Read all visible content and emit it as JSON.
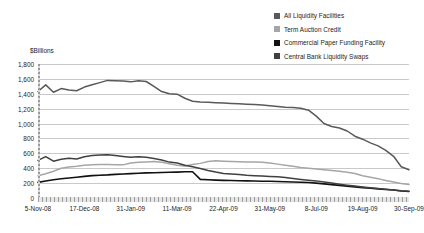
{
  "legend": {
    "position": "top-right",
    "items": [
      {
        "label": "All Liquidity Facilities",
        "color": "#595959",
        "swatch": "legend-swatch-all-liquidity"
      },
      {
        "label": "Term Auction Credit",
        "color": "#a6a6a6",
        "swatch": "legend-swatch-term-auction"
      },
      {
        "label": "Commercial Paper Funding Facility",
        "color": "#111111",
        "swatch": "legend-swatch-cpff"
      },
      {
        "label": "Central Bank Liquidity Swaps",
        "color": "#404040",
        "swatch": "legend-swatch-swaps"
      }
    ]
  },
  "axis": {
    "y_title": "$Billions",
    "y_ticks": [
      "1,800",
      "1,600",
      "1,400",
      "1,200",
      "1,000",
      "800",
      "600",
      "400",
      "200",
      "0"
    ],
    "x_ticks": [
      "5-Nov-08",
      "17-Dec-08",
      "31-Jan-09",
      "11-Mar-09",
      "22-Apr-09",
      "31-May-09",
      "8-Jul-09",
      "19-Aug-09",
      "30-Sep-09"
    ]
  },
  "chart_data": {
    "type": "line",
    "title": "",
    "subtitle": "",
    "xlabel": "",
    "ylabel": "$Billions",
    "ylim": [
      0,
      1800
    ],
    "ytick_step": 200,
    "grid": true,
    "legend_position": "top-right",
    "x_tick_labels": [
      "5-Nov-08",
      "17-Dec-08",
      "31-Jan-09",
      "11-Mar-09",
      "22-Apr-09",
      "31-May-09",
      "8-Jul-09",
      "19-Aug-09",
      "30-Sep-09"
    ],
    "x_tick_index": [
      0,
      6,
      12,
      18,
      24,
      30,
      36,
      42,
      48
    ],
    "x_weekly_count": 49,
    "series": [
      {
        "name": "All Liquidity Facilities",
        "color": "#595959",
        "values": [
          1430,
          1520,
          1420,
          1470,
          1450,
          1440,
          1490,
          1520,
          1550,
          1580,
          1575,
          1570,
          1560,
          1575,
          1565,
          1500,
          1430,
          1400,
          1395,
          1340,
          1300,
          1290,
          1285,
          1280,
          1275,
          1270,
          1265,
          1260,
          1255,
          1250,
          1240,
          1230,
          1220,
          1215,
          1205,
          1180,
          1100,
          1000,
          960,
          940,
          900,
          830,
          790,
          740,
          700,
          640,
          560,
          420,
          380
        ]
      },
      {
        "name": "Term Auction Credit",
        "color": "#a6a6a6",
        "values": [
          300,
          325,
          360,
          400,
          415,
          425,
          440,
          447,
          450,
          450,
          448,
          445,
          470,
          480,
          485,
          490,
          480,
          460,
          440,
          430,
          450,
          465,
          490,
          500,
          495,
          490,
          487,
          485,
          483,
          480,
          470,
          455,
          440,
          425,
          410,
          400,
          390,
          380,
          370,
          360,
          345,
          330,
          300,
          280,
          260,
          235,
          215,
          195,
          180
        ]
      },
      {
        "name": "Commercial Paper Funding Facility",
        "color": "#111111",
        "values": [
          210,
          228,
          245,
          258,
          268,
          278,
          290,
          300,
          305,
          310,
          318,
          322,
          328,
          332,
          337,
          340,
          343,
          345,
          348,
          352,
          353,
          250,
          245,
          240,
          237,
          235,
          232,
          230,
          228,
          226,
          224,
          222,
          218,
          215,
          212,
          208,
          200,
          190,
          180,
          170,
          160,
          150,
          140,
          130,
          122,
          115,
          108,
          95,
          88
        ]
      },
      {
        "name": "Central Bank Liquidity Swaps",
        "color": "#404040",
        "values": [
          505,
          555,
          495,
          520,
          535,
          525,
          555,
          570,
          578,
          582,
          570,
          558,
          548,
          555,
          548,
          530,
          510,
          482,
          470,
          440,
          420,
          395,
          370,
          348,
          330,
          322,
          315,
          305,
          300,
          295,
          290,
          285,
          275,
          262,
          250,
          240,
          230,
          215,
          200,
          185,
          172,
          160,
          148,
          138,
          128,
          118,
          108,
          98,
          92
        ]
      }
    ]
  }
}
